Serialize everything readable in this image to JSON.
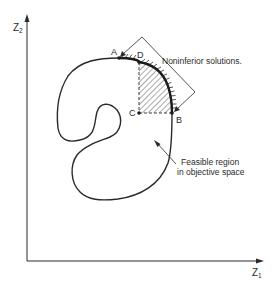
{
  "figure": {
    "type": "objective-space diagram",
    "colors": {
      "ink": "#2a2a2a",
      "background": "#ffffff"
    }
  },
  "axes": {
    "x": {
      "label": "Z",
      "subscript": "1"
    },
    "y": {
      "label": "Z",
      "subscript": "2"
    }
  },
  "points": {
    "A": {
      "label": "A"
    },
    "B": {
      "label": "B"
    },
    "C": {
      "label": "C"
    },
    "D": {
      "label": "D"
    }
  },
  "annotations": {
    "noninferior": "Noninferior solutions.",
    "feasible_line1": "Feasible region",
    "feasible_line2": "in objective space"
  }
}
